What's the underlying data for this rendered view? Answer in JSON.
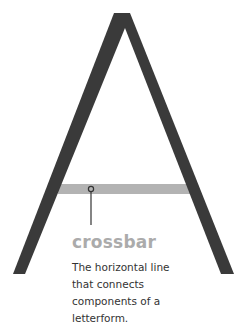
{
  "diagram": {
    "letter": "A",
    "highlighted_part": "crossbar",
    "colors": {
      "letter_stroke": "#3a3a3a",
      "highlight": "#b3b3b3",
      "term_text": "#ababab",
      "body_text": "#333333",
      "pointer": "#333333"
    }
  },
  "label": {
    "term": "crossbar",
    "description": "The horizontal line that connects components of a letterform."
  }
}
